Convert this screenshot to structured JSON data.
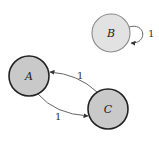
{
  "diagram": {
    "type": "directed-graph",
    "nodes": [
      {
        "id": "A",
        "label": "A",
        "cx": 29,
        "cy": 76,
        "r": 20,
        "fill": "#c9c9c9",
        "stroke": "#222222",
        "stroke_width": 1.6
      },
      {
        "id": "B",
        "label": "B",
        "cx": 111,
        "cy": 33,
        "r": 19,
        "fill": "#e2e2e2",
        "stroke": "#8a8a8a",
        "stroke_width": 1.1
      },
      {
        "id": "C",
        "label": "C",
        "cx": 108,
        "cy": 109,
        "r": 20,
        "fill": "#c9c9c9",
        "stroke": "#222222",
        "stroke_width": 1.6
      }
    ],
    "edges": [
      {
        "id": "C-A",
        "from": "C",
        "to": "A",
        "weight": "1",
        "label_x": 80,
        "label_y": 78
      },
      {
        "id": "A-C",
        "from": "A",
        "to": "C",
        "weight": "1",
        "label_x": 57,
        "label_y": 120
      },
      {
        "id": "B-B",
        "from": "B",
        "to": "B",
        "weight": "1",
        "label_x": 150,
        "label_y": 37
      }
    ],
    "edge_color": "#555555"
  }
}
